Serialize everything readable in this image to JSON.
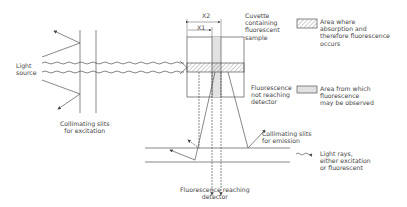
{
  "labels": {
    "light_source": "Light\nsource",
    "slits_excitation": "Collimating slits\nfor excitation",
    "cuvette": "Cuvette\ncontaining\nfluorescent\nsample",
    "x2": "X2",
    "x1": "X1",
    "fluor_not_reaching": "Fluorescence\nnot reaching\ndetector",
    "slits_emission": "Collimating slits\nfor emission",
    "fluor_reaching": "Fluorescence reaching\ndetector"
  },
  "legend": [
    {
      "swatch": "hatched",
      "text": "Area where\nabsorption and\ntherefore fluorescence\noccurs"
    },
    {
      "swatch": "shaded",
      "text": "Area from which\nfluorescence\nmay be observed"
    },
    {
      "swatch": "wavy-arrow",
      "text": "Light rays,\neither excitation\nor fluorescent"
    }
  ],
  "colors": {
    "line": "#555555",
    "hatch": "#888888",
    "shade": "#e2e2e2"
  }
}
